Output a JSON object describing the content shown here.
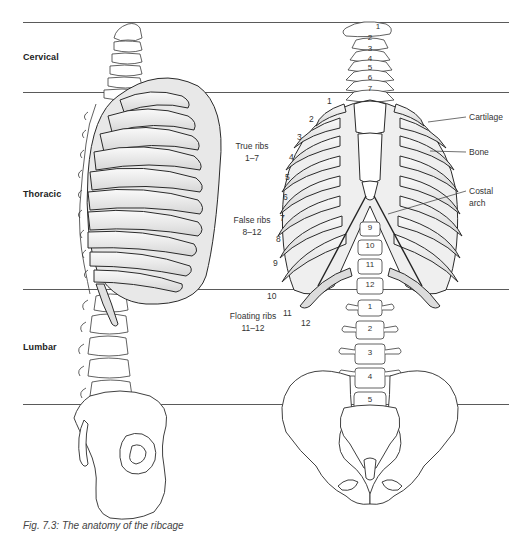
{
  "figure": {
    "caption": "Fig. 7.3: The anatomy of the ribcage",
    "views": [
      "lateral-view",
      "anterior-view"
    ]
  },
  "regions": [
    {
      "label": "Cervical",
      "top_line_y": 22,
      "bottom_line_y": 92
    },
    {
      "label": "Thoracic",
      "top_line_y": 92,
      "bottom_line_y": 289
    },
    {
      "label": "Lumbar",
      "top_line_y": 289,
      "bottom_line_y": 404
    }
  ],
  "rib_groups": [
    {
      "title": "True ribs",
      "range": "1–7"
    },
    {
      "title": "False ribs",
      "range": "8–12"
    },
    {
      "title": "Floating ribs",
      "range": "11–12"
    }
  ],
  "callouts": [
    {
      "label": "Cartilage"
    },
    {
      "label": "Bone"
    },
    {
      "label": "Costal",
      "label2": "arch"
    }
  ],
  "rib_numbers": [
    "1",
    "2",
    "3",
    "4",
    "5",
    "6",
    "7",
    "8",
    "9",
    "10",
    "11",
    "12"
  ],
  "cervical_vertebrae": [
    "1",
    "2",
    "3",
    "4",
    "5",
    "6",
    "7"
  ],
  "thoracic_vertebrae": [
    "9",
    "10",
    "11",
    "12"
  ],
  "lumbar_vertebrae": [
    "1",
    "2",
    "3",
    "4",
    "5"
  ],
  "colors": {
    "line": "#5a5a5a",
    "bone_fill": "#f2f2f2",
    "bone_shade": "#cfcfcf",
    "outline": "#3a3a3a"
  }
}
